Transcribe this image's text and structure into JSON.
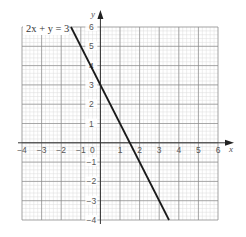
{
  "chart_data": {
    "type": "line",
    "title": "",
    "xlabel": "x",
    "ylabel": "y",
    "xlim": [
      -4,
      6
    ],
    "ylim": [
      -4,
      6
    ],
    "grid": true,
    "minor_grid_divisions": 5,
    "x_ticks": [
      "−4",
      "−3",
      "−2",
      "−1",
      "0",
      "1",
      "2",
      "3",
      "4",
      "5",
      "6"
    ],
    "y_ticks": [
      "−4",
      "−3",
      "−2",
      "−1",
      "1",
      "2",
      "3",
      "4",
      "5",
      "6"
    ],
    "series": [
      {
        "name": "2x + y = 3",
        "equation": "y = 3 − 2x",
        "x": [
          -1.5,
          3.5
        ],
        "y": [
          6,
          -4
        ],
        "color": "#1a1a1a"
      }
    ],
    "annotations": [
      {
        "text": "2x + y = 3",
        "position": "top-left"
      }
    ]
  },
  "labels": {
    "equation": "2x + y = 3",
    "x_axis": "x",
    "y_axis": "y",
    "origin": "0"
  }
}
